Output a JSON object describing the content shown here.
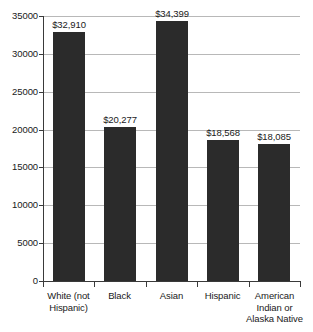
{
  "chart_data": {
    "type": "bar",
    "title": "",
    "subtitle": "",
    "xlabel": "",
    "ylabel": "",
    "categories": [
      "White (not Hispanic)",
      "Black",
      "Asian",
      "Hispanic",
      "American Indian or Alaska Native"
    ],
    "category_lines": [
      [
        "White (not",
        "Hispanic)"
      ],
      [
        "Black"
      ],
      [
        "Asian"
      ],
      [
        "Hispanic"
      ],
      [
        "American",
        "Indian or",
        "Alaska Native"
      ]
    ],
    "values": [
      32910,
      20277,
      34399,
      18568,
      18085
    ],
    "value_labels": [
      "$32,910",
      "$20,277",
      "$34,399",
      "$18,568",
      "$18,085"
    ],
    "ylim": [
      0,
      35000
    ],
    "ytick_values": [
      0,
      5000,
      10000,
      15000,
      20000,
      25000,
      30000,
      35000
    ],
    "ytick_labels": [
      "0",
      "5000",
      "10000",
      "15000",
      "20000",
      "25000",
      "30000",
      "35000"
    ],
    "grid": true,
    "grid_axis": "y",
    "legend": false,
    "legend_position": "none",
    "bar_color": "#2b2b2b",
    "gridline_color": "#b8b8b8",
    "axis_color": "#3a3a3a",
    "background_color": "#ffffff",
    "text_color": "#1a1a1a"
  }
}
